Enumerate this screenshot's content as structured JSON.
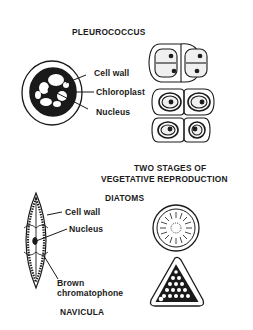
{
  "pleurococcus": {
    "title": "PLEUROCOCCUS",
    "labels": {
      "cell_wall": "Cell wall",
      "chloroplast": "Chloroplast",
      "nucleus": "Nucleus"
    },
    "caption_line1": "TWO STAGES OF",
    "caption_line2": "VEGETATIVE REPRODUCTION"
  },
  "diatoms": {
    "title": "DIATOMS",
    "labels": {
      "cell_wall": "Cell wall",
      "nucleus": "Nucleus",
      "brown_line1": "Brown",
      "brown_line2": "chromatophone"
    },
    "navicula": "NAVICULA"
  },
  "colors": {
    "ink": "#1a1a1a",
    "background": "#ffffff",
    "stipple": "#e8e8e8"
  }
}
